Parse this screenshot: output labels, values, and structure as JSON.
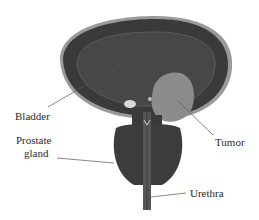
{
  "figure": {
    "type": "anatomical-diagram"
  },
  "labels": {
    "bladder": "Bladder",
    "prostate_line1": "Prostate",
    "prostate_line2": "gland",
    "tumor": "Tumor",
    "urethra": "Urethra"
  },
  "colors": {
    "background": "#ffffff",
    "bladder_wall_outer": "#9a9a9a",
    "bladder_wall": "#3a3a3a",
    "bladder_lumen": "#474747",
    "lumen_edge": "#5a5a5a",
    "tumor": "#8c8c8c",
    "prostate": "#3c3c3c",
    "urethra": "#565656",
    "text": "#2a2a2a",
    "leader_line": "#555555"
  }
}
